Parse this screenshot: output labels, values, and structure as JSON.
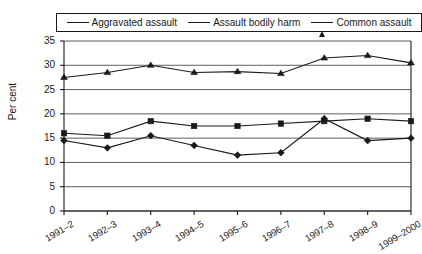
{
  "chart_data": {
    "type": "line",
    "title": "",
    "xlabel": "",
    "ylabel": "Per cent",
    "categories": [
      "1991–2",
      "1992–3",
      "1993–4",
      "1994–5",
      "1995–6",
      "1996–7",
      "1997–8",
      "1998–9",
      "1999–2000"
    ],
    "ylim": [
      0,
      35
    ],
    "ytick_values": [
      0,
      5,
      10,
      15,
      20,
      25,
      30,
      35
    ],
    "ytick_labels": [
      "0",
      "5",
      "10",
      "15",
      "20",
      "25",
      "30",
      "35"
    ],
    "grid": "horizontal",
    "legend_position": "top",
    "series": [
      {
        "name": "Aggravated assault",
        "marker": "diamond",
        "color": "#1a1a1a",
        "values": [
          14.5,
          13.0,
          15.5,
          13.5,
          11.5,
          12.0,
          19.0,
          14.5,
          15.0
        ]
      },
      {
        "name": "Assault bodily harm",
        "marker": "square",
        "color": "#1a1a1a",
        "values": [
          16.0,
          15.5,
          18.5,
          17.5,
          17.5,
          18.0,
          18.5,
          19.0,
          18.5
        ]
      },
      {
        "name": "Common assault",
        "marker": "triangle",
        "color": "#1a1a1a",
        "values": [
          27.5,
          28.5,
          30.0,
          28.5,
          28.7,
          28.3,
          31.5,
          32.0,
          30.5
        ]
      }
    ]
  }
}
